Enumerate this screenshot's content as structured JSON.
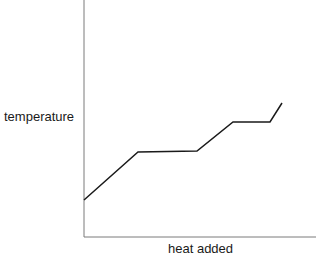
{
  "chart_data": {
    "type": "line",
    "title": "",
    "xlabel": "heat added",
    "ylabel": "temperature",
    "grid": false,
    "legend": null,
    "ticks": false,
    "series": [
      {
        "name": "heating curve",
        "x": [
          0,
          55,
          114,
          150,
          187,
          199
        ],
        "y": [
          37,
          85,
          86,
          115,
          115,
          134
        ],
        "segments": [
          "rising",
          "plateau",
          "rising",
          "plateau",
          "rising"
        ]
      }
    ],
    "pixel_points": [
      [
        84,
        200
      ],
      [
        138,
        152
      ],
      [
        197,
        151
      ],
      [
        233,
        122
      ],
      [
        270,
        122
      ],
      [
        282,
        103
      ]
    ],
    "axes": {
      "origin": [
        84,
        237
      ],
      "x_end": 316,
      "y_top": 0
    },
    "colors": {
      "line": "#1a1a1a",
      "axis": "#7a7a7a",
      "text": "#1a1a1a"
    }
  }
}
